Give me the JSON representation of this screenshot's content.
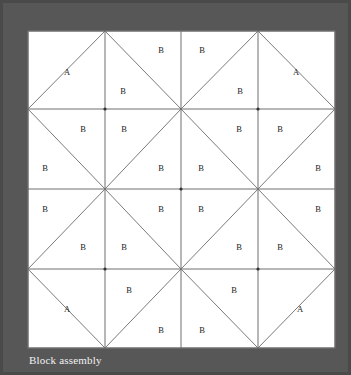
{
  "figure": {
    "caption": "Block assembly",
    "background_color": "#575757",
    "border_color": "#4a4a4a",
    "block_fill": "#ffffff",
    "line_color": "#6e6e6e",
    "diagonal_color": "#7a7a7a",
    "label_color": "#1c1c1c",
    "caption_color": "#f2f2f2"
  },
  "block": {
    "x": 25,
    "y": 28,
    "width": 307,
    "height": 317,
    "grid_columns": 4,
    "grid_rows": 4,
    "x_lines": [
      25,
      102,
      178,
      255,
      332
    ],
    "y_lines": [
      28,
      106,
      186,
      266,
      345
    ],
    "diagonal_nodes": [
      {
        "x": 102,
        "y": 106
      },
      {
        "x": 255,
        "y": 106
      },
      {
        "x": 178,
        "y": 186
      },
      {
        "x": 102,
        "y": 266
      },
      {
        "x": 255,
        "y": 266
      }
    ]
  },
  "diagonals": [
    {
      "x1": 102,
      "y1": 28,
      "x2": 178,
      "y2": 106
    },
    {
      "x1": 255,
      "y1": 28,
      "x2": 178,
      "y2": 106
    },
    {
      "x1": 102,
      "y1": 28,
      "x2": 25,
      "y2": 106
    },
    {
      "x1": 255,
      "y1": 28,
      "x2": 332,
      "y2": 106
    },
    {
      "x1": 25,
      "y1": 106,
      "x2": 102,
      "y2": 186
    },
    {
      "x1": 178,
      "y1": 106,
      "x2": 102,
      "y2": 186
    },
    {
      "x1": 178,
      "y1": 106,
      "x2": 255,
      "y2": 186
    },
    {
      "x1": 332,
      "y1": 106,
      "x2": 255,
      "y2": 186
    },
    {
      "x1": 102,
      "y1": 186,
      "x2": 178,
      "y2": 266
    },
    {
      "x1": 255,
      "y1": 186,
      "x2": 178,
      "y2": 266
    },
    {
      "x1": 102,
      "y1": 186,
      "x2": 25,
      "y2": 266
    },
    {
      "x1": 255,
      "y1": 186,
      "x2": 332,
      "y2": 266
    },
    {
      "x1": 25,
      "y1": 266,
      "x2": 102,
      "y2": 345
    },
    {
      "x1": 178,
      "y1": 266,
      "x2": 102,
      "y2": 345
    },
    {
      "x1": 178,
      "y1": 266,
      "x2": 255,
      "y2": 345
    },
    {
      "x1": 332,
      "y1": 266,
      "x2": 255,
      "y2": 345
    }
  ],
  "patches": [
    {
      "label": "A",
      "x": 64,
      "y": 70
    },
    {
      "label": "B",
      "x": 158,
      "y": 48
    },
    {
      "label": "B",
      "x": 199,
      "y": 48
    },
    {
      "label": "A",
      "x": 293,
      "y": 70
    },
    {
      "label": "B",
      "x": 120,
      "y": 89
    },
    {
      "label": "B",
      "x": 237,
      "y": 89
    },
    {
      "label": "B",
      "x": 80,
      "y": 127
    },
    {
      "label": "B",
      "x": 121,
      "y": 127
    },
    {
      "label": "B",
      "x": 236,
      "y": 127
    },
    {
      "label": "B",
      "x": 277,
      "y": 127
    },
    {
      "label": "B",
      "x": 42,
      "y": 166
    },
    {
      "label": "B",
      "x": 158,
      "y": 166
    },
    {
      "label": "B",
      "x": 198,
      "y": 166
    },
    {
      "label": "B",
      "x": 315,
      "y": 166
    },
    {
      "label": "B",
      "x": 42,
      "y": 207
    },
    {
      "label": "B",
      "x": 158,
      "y": 207
    },
    {
      "label": "B",
      "x": 198,
      "y": 207
    },
    {
      "label": "B",
      "x": 315,
      "y": 207
    },
    {
      "label": "B",
      "x": 80,
      "y": 245
    },
    {
      "label": "B",
      "x": 121,
      "y": 245
    },
    {
      "label": "B",
      "x": 236,
      "y": 245
    },
    {
      "label": "B",
      "x": 277,
      "y": 245
    },
    {
      "label": "A",
      "x": 64,
      "y": 307
    },
    {
      "label": "B",
      "x": 126,
      "y": 288
    },
    {
      "label": "B",
      "x": 231,
      "y": 288
    },
    {
      "label": "A",
      "x": 297,
      "y": 307
    },
    {
      "label": "B",
      "x": 158,
      "y": 328
    },
    {
      "label": "B",
      "x": 199,
      "y": 328
    }
  ]
}
